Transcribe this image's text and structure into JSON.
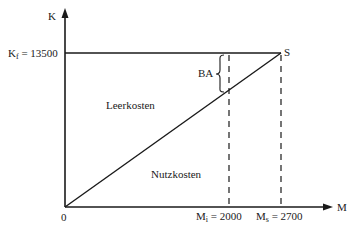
{
  "diagram": {
    "y_axis_label": "K",
    "x_axis_label": "M",
    "origin_label": "0",
    "fixed_cost": {
      "symbol": "K",
      "subscript": "f",
      "value_text": " = 13500",
      "value": 13500
    },
    "point_s_label": "S",
    "brace_label": "BA",
    "region_upper_label": "Leerkosten",
    "region_lower_label": "Nutzkosten",
    "m_i": {
      "symbol": "M",
      "subscript": "i",
      "value_text": " = 2000",
      "value": 2000
    },
    "m_s": {
      "symbol": "M",
      "subscript": "s",
      "value_text": " = 2700",
      "value": 2700
    }
  }
}
